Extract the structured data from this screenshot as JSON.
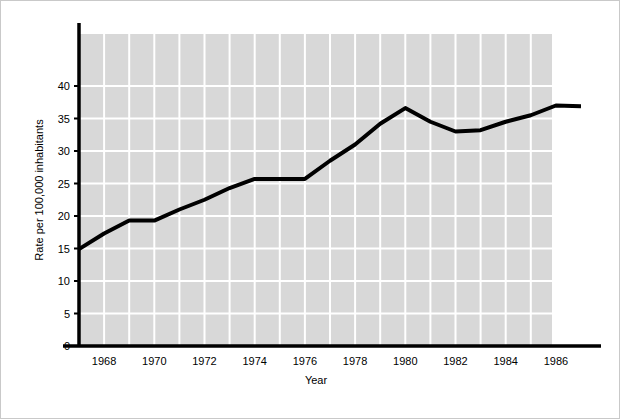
{
  "chart_data": {
    "type": "line",
    "title": "",
    "xlabel": "Year",
    "ylabel": "Rate per 100,000 inhabitants",
    "x": [
      1967,
      1968,
      1969,
      1970,
      1971,
      1972,
      1973,
      1974,
      1975,
      1976,
      1977,
      1978,
      1979,
      1980,
      1981,
      1982,
      1983,
      1984,
      1985,
      1986,
      1987
    ],
    "values": [
      14.9,
      17.3,
      19.3,
      19.3,
      21.0,
      22.5,
      24.3,
      25.7,
      25.7,
      25.7,
      28.5,
      31.0,
      34.2,
      36.6,
      34.5,
      33.0,
      33.2,
      34.5,
      35.5,
      37.0,
      36.9
    ],
    "series": [
      {
        "name": "Rate per 100,000 inhabitants",
        "values": [
          14.9,
          17.3,
          19.3,
          19.3,
          21.0,
          22.5,
          24.3,
          25.7,
          25.7,
          25.7,
          28.5,
          31.0,
          34.2,
          36.6,
          34.5,
          33.0,
          33.2,
          34.5,
          35.5,
          37.0,
          36.9
        ]
      }
    ],
    "xlim": [
      1967,
      1987
    ],
    "ylim": [
      0,
      44
    ],
    "ytick_labels": [
      "0",
      "5",
      "10",
      "15",
      "20",
      "25",
      "30",
      "35",
      "40"
    ],
    "ytick_values": [
      0,
      5,
      10,
      15,
      20,
      25,
      30,
      35,
      40
    ],
    "xtick_labels": [
      "1968",
      "1970",
      "1972",
      "1974",
      "1976",
      "1978",
      "1980",
      "1982",
      "1984",
      "1986"
    ],
    "xtick_values": [
      1968,
      1970,
      1972,
      1974,
      1976,
      1978,
      1980,
      1982,
      1984,
      1986
    ],
    "grid": true,
    "grid_color": "#ffffff",
    "plot_background": "#d8d8d8",
    "line_color": "#000000",
    "line_width": 4,
    "legend": null,
    "legend_position": "none",
    "figure_background": "#ffffff"
  },
  "axes": {
    "y_title": "Rate per 100,000 inhabitants",
    "x_title": "Year"
  }
}
